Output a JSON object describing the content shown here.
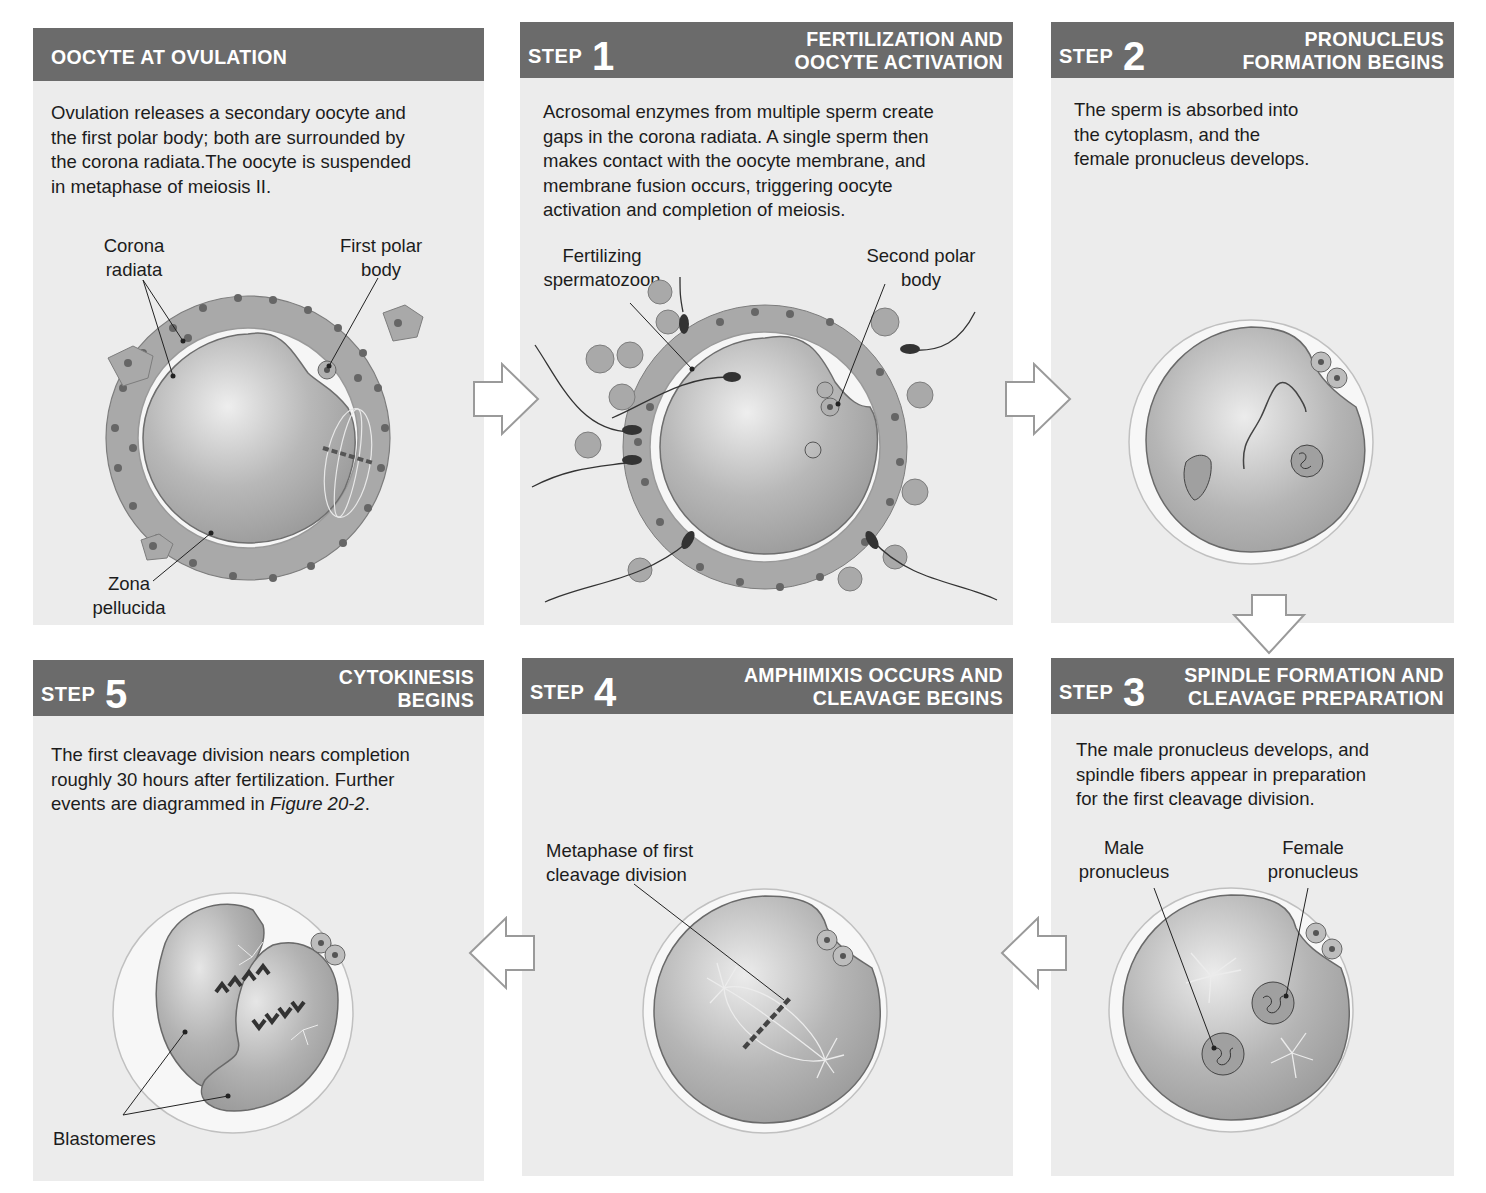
{
  "figure": {
    "panels": [
      {
        "id": "ovulation",
        "step_label": "",
        "step_number": "",
        "title_lines": [
          "OOCYTE AT OVULATION"
        ],
        "description": [
          "Ovulation releases a secondary oocyte and",
          "the first polar body; both are surrounded by",
          "the corona radiata.The oocyte is suspended",
          "in metaphase of meiosis II."
        ],
        "labels": {
          "corona_radiata": [
            "Corona",
            "radiata"
          ],
          "first_polar_body": [
            "First polar",
            "body"
          ],
          "zona_pellucida": [
            "Zona",
            "pellucida"
          ]
        }
      },
      {
        "id": "step1",
        "step_label": "STEP",
        "step_number": "1",
        "title_lines": [
          "FERTILIZATION AND",
          "OOCYTE ACTIVATION"
        ],
        "description": [
          "Acrosomal enzymes from multiple sperm create",
          "gaps in the corona radiata. A single sperm then",
          "makes contact with the oocyte membrane, and",
          "membrane fusion occurs, triggering oocyte",
          "activation and completion of meiosis."
        ],
        "labels": {
          "fertilizing_spermatozoon": [
            "Fertilizing",
            "spermatozoon"
          ],
          "second_polar_body": [
            "Second polar",
            "body"
          ]
        }
      },
      {
        "id": "step2",
        "step_label": "STEP",
        "step_number": "2",
        "title_lines": [
          "PRONUCLEUS",
          "FORMATION BEGINS"
        ],
        "description": [
          "The sperm is absorbed into",
          "the cytoplasm, and the",
          "female pronucleus develops."
        ],
        "labels": {}
      },
      {
        "id": "step3",
        "step_label": "STEP",
        "step_number": "3",
        "title_lines": [
          "SPINDLE FORMATION AND",
          "CLEAVAGE PREPARATION"
        ],
        "description": [
          "The male pronucleus develops, and",
          "spindle fibers appear in preparation",
          "for the first cleavage division."
        ],
        "labels": {
          "male_pronucleus": [
            "Male",
            "pronucleus"
          ],
          "female_pronucleus": [
            "Female",
            "pronucleus"
          ]
        }
      },
      {
        "id": "step4",
        "step_label": "STEP",
        "step_number": "4",
        "title_lines": [
          "AMPHIMIXIS OCCURS AND",
          "CLEAVAGE BEGINS"
        ],
        "description": [],
        "labels": {
          "metaphase": [
            "Metaphase of first",
            "cleavage division"
          ]
        }
      },
      {
        "id": "step5",
        "step_label": "STEP",
        "step_number": "5",
        "title_lines": [
          "CYTOKINESIS",
          "BEGINS"
        ],
        "description": [
          "The first cleavage division nears completion",
          "roughly 30 hours after fertilization. Further",
          "events are diagrammed in "
        ],
        "description_italic": "Figure 20-2",
        "description_tail": ".",
        "labels": {
          "blastomeres": "Blastomeres"
        }
      }
    ],
    "arrows": [
      {
        "from": "ovulation",
        "to": "step1",
        "direction": "right"
      },
      {
        "from": "step1",
        "to": "step2",
        "direction": "right"
      },
      {
        "from": "step2",
        "to": "step3",
        "direction": "down"
      },
      {
        "from": "step3",
        "to": "step4",
        "direction": "left"
      },
      {
        "from": "step4",
        "to": "step5",
        "direction": "left"
      }
    ],
    "colors": {
      "header_bg": "#6b6b6b",
      "panel_bg": "#ececec",
      "cell_fill": "#a8a8a8",
      "oocyte_fill": "#b5b5b5",
      "nucleus_dot": "#555555",
      "arrow_stroke": "#9a9a9a"
    }
  }
}
